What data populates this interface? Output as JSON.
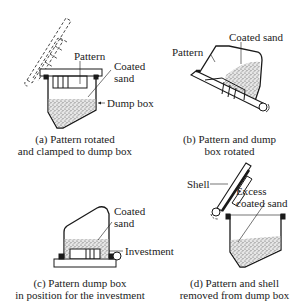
{
  "figure": {
    "panels": [
      {
        "id": "a",
        "caption_line1": "(a) Pattern rotated",
        "caption_line2": "and clamped to dump box",
        "labels": {
          "pattern": "Pattern",
          "coated_sand_1": "Coated",
          "coated_sand_2": "sand",
          "dump_box": "Dump box"
        }
      },
      {
        "id": "b",
        "caption_line1": "(b) Pattern and dump",
        "caption_line2": "box rotated",
        "labels": {
          "pattern": "Pattern",
          "coated_sand": "Coated sand"
        }
      },
      {
        "id": "c",
        "caption_line1": "(c) Pattern dump box",
        "caption_line2": "in position for the investment",
        "labels": {
          "coated_sand_1": "Coated",
          "coated_sand_2": "sand",
          "investment": "Investment"
        }
      },
      {
        "id": "d",
        "caption_line1": "(d) Pattern and shell",
        "caption_line2": "removed from dump box",
        "labels": {
          "shell": "Shell",
          "excess_1": "Excess",
          "excess_2": "coated sand"
        }
      }
    ],
    "colors": {
      "line": "#1a1a1a",
      "sand": "#bdbdbd",
      "background": "#ffffff"
    }
  }
}
